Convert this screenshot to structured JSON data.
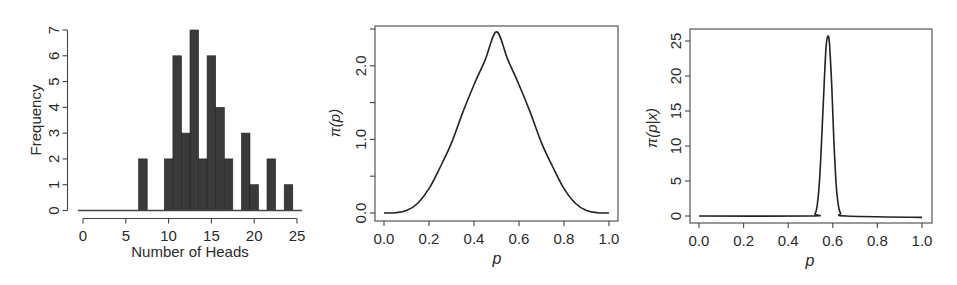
{
  "chart_data": [
    {
      "type": "bar",
      "title": "",
      "xlabel": "Number of Heads",
      "ylabel": "Frequency",
      "xlim": [
        0,
        25
      ],
      "ylim": [
        0,
        7
      ],
      "xticks": [
        "0",
        "5",
        "10",
        "15",
        "20",
        "25"
      ],
      "yticks": [
        "0",
        "1",
        "2",
        "3",
        "4",
        "5",
        "6",
        "7"
      ],
      "grid": false,
      "frame": false,
      "bar_color": "#3a3a3a",
      "categories": [
        7,
        10,
        11,
        12,
        13,
        14,
        15,
        16,
        17,
        19,
        20,
        22,
        24
      ],
      "values": [
        2,
        2,
        6,
        3,
        7,
        2,
        6,
        4,
        2,
        3,
        1,
        2,
        1
      ]
    },
    {
      "type": "line",
      "title": "",
      "xlabel": "p",
      "ylabel": "π(p)",
      "xlim": [
        0,
        1
      ],
      "ylim": [
        0,
        2.5
      ],
      "xticks": [
        "0.0",
        "0.2",
        "0.4",
        "0.6",
        "0.8",
        "1.0"
      ],
      "yticks": [
        "0.0",
        "",
        "1.0",
        "",
        "2.0",
        ""
      ],
      "ytick_values": [
        0,
        0.5,
        1.0,
        1.5,
        2.0,
        2.5
      ],
      "grid": false,
      "frame": true,
      "series": [
        {
          "name": "prior",
          "x": [
            0.0,
            0.05,
            0.1,
            0.15,
            0.2,
            0.25,
            0.3,
            0.35,
            0.4,
            0.45,
            0.5,
            0.55,
            0.6,
            0.65,
            0.7,
            0.75,
            0.8,
            0.85,
            0.9,
            0.95,
            1.0
          ],
          "values": [
            0.0,
            0.003,
            0.033,
            0.133,
            0.33,
            0.625,
            0.953,
            1.367,
            1.742,
            2.084,
            2.461,
            2.084,
            1.742,
            1.367,
            0.953,
            0.625,
            0.33,
            0.133,
            0.033,
            0.003,
            0.0
          ]
        }
      ]
    },
    {
      "type": "line",
      "title": "",
      "xlabel": "p",
      "ylabel": "π(p|x)",
      "xlim": [
        0,
        1
      ],
      "ylim": [
        0,
        26
      ],
      "xticks": [
        "0.0",
        "0.2",
        "0.4",
        "0.6",
        "0.8",
        "1.0"
      ],
      "yticks": [
        "0",
        "5",
        "10",
        "15",
        "20",
        "25"
      ],
      "grid": false,
      "frame": true,
      "series": [
        {
          "name": "posterior",
          "x": [
            0.0,
            0.5,
            0.52,
            0.53,
            0.54,
            0.55,
            0.56,
            0.57,
            0.578,
            0.585,
            0.595,
            0.605,
            0.615,
            0.625,
            0.635,
            0.66,
            1.0
          ],
          "values": [
            0.0,
            0.0,
            0.3,
            1.5,
            4.8,
            10.8,
            18.0,
            24.2,
            25.7,
            24.6,
            18.8,
            10.6,
            4.6,
            1.5,
            0.4,
            0.0,
            -0.2
          ]
        }
      ]
    }
  ]
}
